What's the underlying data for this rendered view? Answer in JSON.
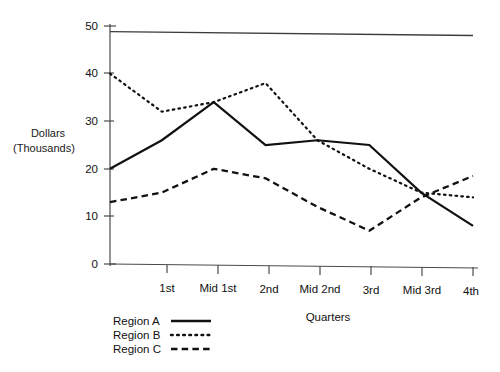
{
  "chart_data": {
    "type": "line",
    "title": "",
    "xlabel": "Quarters",
    "ylabel_line1": "Dollars",
    "ylabel_line2": "(Thousands)",
    "categories": [
      "",
      "1st",
      "Mid 1st",
      "2nd",
      "Mid 2nd",
      "3rd",
      "Mid 3rd",
      "4th"
    ],
    "ylim": [
      0,
      50
    ],
    "yticks": [
      0,
      10,
      20,
      30,
      40,
      50
    ],
    "ytick_labels": [
      "0",
      "10",
      "20",
      "30",
      "40",
      "50"
    ],
    "grid": false,
    "legend_position": "bottom-left",
    "series": [
      {
        "name": "Region A",
        "style": "solid",
        "values": [
          20,
          26,
          34,
          25,
          26,
          25,
          15,
          8
        ]
      },
      {
        "name": "Region B",
        "style": "dotted",
        "values": [
          40,
          32,
          34,
          38,
          26,
          20,
          15,
          14
        ]
      },
      {
        "name": "Region C",
        "style": "dashed",
        "values": [
          13,
          15,
          20,
          18,
          12,
          7,
          14,
          18.5
        ]
      }
    ],
    "reference_line": {
      "name": "top-rule",
      "start_value": 48.8,
      "end_value": 48.0
    }
  },
  "axis": {
    "y_label_line1": "Dollars",
    "y_label_line2": "(Thousands)",
    "x_title": "Quarters",
    "y_tick_0": "0",
    "y_tick_10": "10",
    "y_tick_20": "20",
    "y_tick_30": "30",
    "y_tick_40": "40",
    "y_tick_50": "50",
    "x_tick_1": "1st",
    "x_tick_2": "Mid 1st",
    "x_tick_3": "2nd",
    "x_tick_4": "Mid 2nd",
    "x_tick_5": "3rd",
    "x_tick_6": "Mid 3rd",
    "x_tick_7": "4th"
  },
  "legend": {
    "entry_a": "Region A",
    "entry_b": "Region B",
    "entry_c": "Region C"
  }
}
